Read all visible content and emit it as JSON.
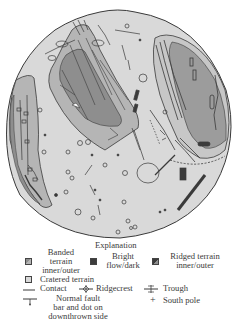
{
  "map": {
    "subject": "geologic map of a moon (south polar view)",
    "colors": {
      "cratered_terrain": "#d9d9d9",
      "banded_outer": "#b5b5b5",
      "banded_inner": "#8e8e8e",
      "ridged_outer": "#c7c7c7",
      "ridged_inner": "#9c9c9c",
      "bright_flow_dark": "#3c3c3c",
      "line": "#3a3a3a"
    }
  },
  "legend": {
    "title": "Explanation",
    "items": [
      {
        "key": "banded",
        "label_lines": [
          "Banded",
          "terrain",
          "inner/outer"
        ]
      },
      {
        "key": "bright",
        "label_lines": [
          "Bright",
          "flow/dark"
        ]
      },
      {
        "key": "ridged",
        "label_lines": [
          "Ridged terrain",
          "inner/outer"
        ]
      },
      {
        "key": "cratered",
        "label": "Cratered terrain"
      },
      {
        "key": "contact",
        "label": "Contact"
      },
      {
        "key": "ridgecrest",
        "label": "Ridgecrest"
      },
      {
        "key": "trough",
        "label": "Trough"
      },
      {
        "key": "normal_fault",
        "label_lines": [
          "Normal fault",
          "bar and dot on",
          "downthrown side"
        ]
      },
      {
        "key": "south_pole",
        "label": "South pole"
      }
    ]
  }
}
